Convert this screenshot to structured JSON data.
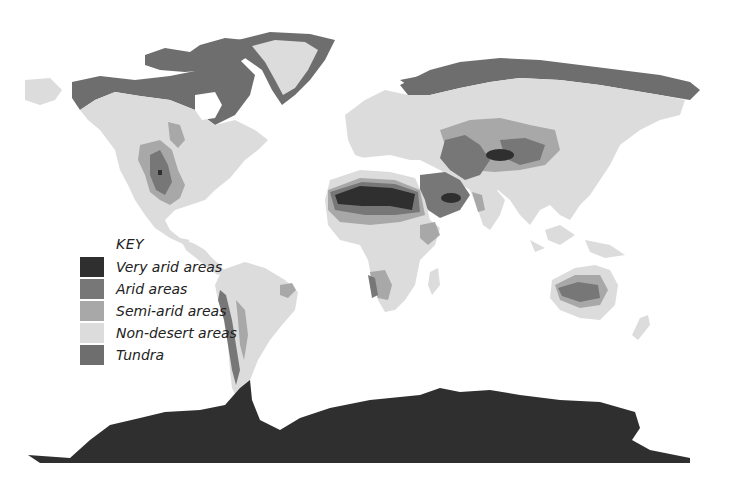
{
  "map": {
    "title": "World desert regions",
    "colors": {
      "very_arid": "#2f2f2f",
      "arid": "#777777",
      "semi_arid": "#a8a8a8",
      "non_desert": "#dcdcdc",
      "tundra": "#6e6e6e",
      "ocean": "#ffffff"
    }
  },
  "legend": {
    "title": "KEY",
    "items": [
      {
        "label": "Very arid areas",
        "color": "#2f2f2f"
      },
      {
        "label": "Arid areas",
        "color": "#777777"
      },
      {
        "label": "Semi-arid areas",
        "color": "#a8a8a8"
      },
      {
        "label": "Non-desert areas",
        "color": "#dcdcdc"
      },
      {
        "label": "Tundra",
        "color": "#6e6e6e"
      }
    ]
  }
}
